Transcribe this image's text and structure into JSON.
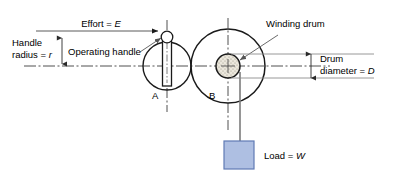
{
  "diagram": {
    "background_color": "#ffffff",
    "line_color": "#1a1a1a",
    "centerline_color": "#3d3d3d",
    "dimension_line_color": "#7a7a7a",
    "leader_color": "#6a6a6a",
    "labels": {
      "effort": "Effort = ",
      "effort_symbol": "E",
      "handle_radius_line1": "Handle",
      "handle_radius_line2": "radius = ",
      "handle_radius_symbol": "r",
      "operating_handle": "Operating handle",
      "winding_drum": "Winding drum",
      "drum_diameter_line1": "Drum",
      "drum_diameter_line2": "diameter = ",
      "drum_diameter_symbol": "D",
      "load": "Load = ",
      "load_symbol": "W",
      "point_a": "A",
      "point_b": "B"
    },
    "parts": {
      "handle_circle": {
        "name": "handle-circle-a",
        "cx": 167,
        "cy": 66,
        "r": 24,
        "fill": "none"
      },
      "wheel_circle": {
        "name": "wheel-circle-b",
        "cx": 228,
        "cy": 66,
        "r": 37,
        "fill": "none"
      },
      "winding_drum": {
        "name": "winding-drum",
        "cx": 228,
        "cy": 66,
        "r": 12,
        "fill": "#ebe7dc"
      },
      "handle_knob": {
        "name": "handle-knob",
        "cx": 167,
        "cy": 37,
        "r": 5.5,
        "fill": "#ffffff"
      },
      "handle_bar": {
        "name": "handle-bar",
        "x": 162.5,
        "y": 38,
        "width": 9,
        "height": 48,
        "fill": "#ffffff"
      },
      "load_block": {
        "name": "load-block",
        "x": 224,
        "y": 141,
        "width": 30,
        "height": 28,
        "fill": "#aebfe2",
        "stroke": "#5f7bb5"
      }
    }
  }
}
